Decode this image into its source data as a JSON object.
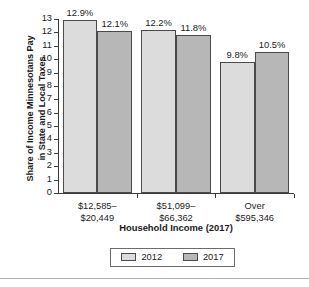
{
  "chart_data": {
    "type": "bar",
    "title": "",
    "xlabel": "Household Income (2017)",
    "ylabel": "Share of Income Minnesotans Pay\nin State and Local Taxes",
    "categories": [
      "$12,585–\n$20,449",
      "$51,099–\n$66,362",
      "Over\n$595,346"
    ],
    "series": [
      {
        "name": "2012",
        "color": "#dcdcdc",
        "values": [
          12.9,
          12.2,
          9.8
        ],
        "labels": [
          "12.9%",
          "12.2%",
          "9.8%"
        ]
      },
      {
        "name": "2017",
        "color": "#b7b7b7",
        "values": [
          12.1,
          11.8,
          10.5
        ],
        "labels": [
          "12.1%",
          "11.8%",
          "10.5%"
        ]
      }
    ],
    "ylim": [
      0,
      13
    ],
    "yticks": [
      0,
      1,
      2,
      3,
      4,
      5,
      6,
      7,
      8,
      9,
      10,
      11,
      12,
      13
    ],
    "ytick_labels": [
      "0",
      "1",
      "2",
      "3",
      "4",
      "5",
      "6",
      "7",
      "8",
      "9",
      "10",
      "11",
      "12",
      "13"
    ],
    "grid": false,
    "legend_position": "bottom",
    "legend_entries": [
      "2012",
      "2017"
    ]
  }
}
